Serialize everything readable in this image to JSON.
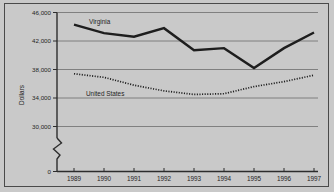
{
  "chart_data": {
    "type": "line",
    "title": "",
    "xlabel": "",
    "ylabel": "Dollars",
    "x": [
      1989,
      1990,
      1991,
      1992,
      1993,
      1994,
      1995,
      1996,
      1997
    ],
    "categories": [
      "1989",
      "1990",
      "1991",
      "1992",
      "1993",
      "1994",
      "1995",
      "1996",
      "1997"
    ],
    "series": [
      {
        "name": "Virginia",
        "values": [
          44300,
          43100,
          42600,
          43800,
          40700,
          41000,
          38200,
          41000,
          43200
        ]
      },
      {
        "name": "United States",
        "values": [
          37400,
          36900,
          35800,
          35000,
          34500,
          34600,
          35600,
          36300,
          37200
        ]
      }
    ],
    "ylim": [
      30000,
      46000
    ],
    "yticks": [
      0,
      30000,
      34000,
      38000,
      42000,
      46000
    ],
    "ytick_labels": [
      "0",
      "30,000",
      "34,000",
      "38,000",
      "42,000",
      "46,000"
    ],
    "xtick_labels": [
      "1989",
      "1990",
      "1991",
      "1992",
      "1993",
      "1994",
      "1995",
      "1996",
      "1997"
    ],
    "grid": true,
    "grid_axis": "y",
    "legend": "inline-labels",
    "axis_break": true,
    "axis_break_note": "y-axis broken between 0 and 30,000"
  },
  "axis": {
    "y_title": "Dollars",
    "y_labels": {
      "t46000": "46,000",
      "t42000": "42,000",
      "t38000": "38,000",
      "t34000": "34,000",
      "t30000": "30,000",
      "t0": "0"
    },
    "x_labels": {
      "y1989": "1989",
      "y1990": "1990",
      "y1991": "1991",
      "y1992": "1992",
      "y1993": "1993",
      "y1994": "1994",
      "y1995": "1995",
      "y1996": "1996",
      "y1997": "1997"
    }
  },
  "series_labels": {
    "virginia": "Virginia",
    "united_states": "United States"
  },
  "colors": {
    "background": "#c9c9c9",
    "frame": "#4a4a4a",
    "gridline": "#6d6d6d",
    "axis": "#2d2d2d",
    "line": "#1e1e1e"
  }
}
